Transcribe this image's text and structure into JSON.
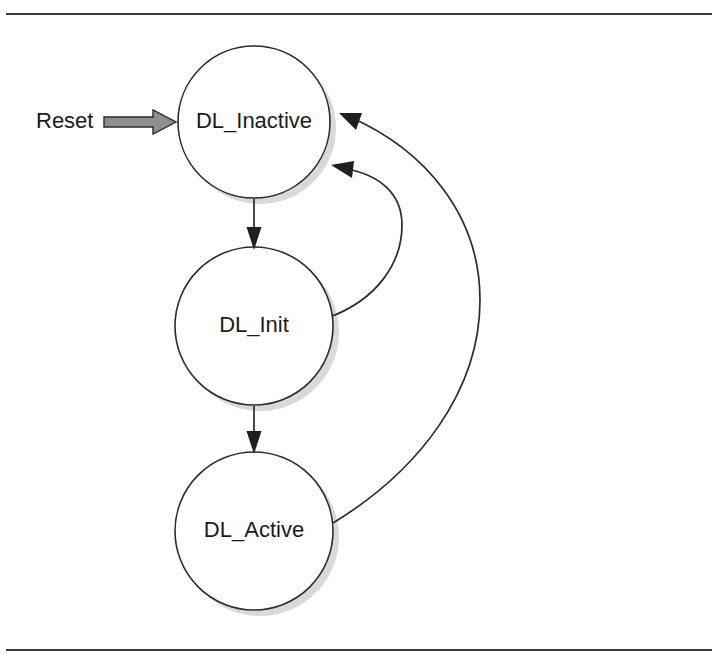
{
  "figure": {
    "kind": "state-transition-diagram",
    "background_color": "#ffffff",
    "line_color": "#2b2b2b",
    "shadow_color": "#b9b9b9",
    "reset_arrow_fill": "#8f8f8f",
    "frame_rule_color": "#3a3a3a"
  },
  "frame": {
    "top_rule_y": 14,
    "bottom_rule_y": 650,
    "rule_left_x": 6,
    "rule_right_x": 712
  },
  "states": [
    {
      "id": "dl-inactive",
      "label": "DL_Inactive",
      "cx": 254,
      "cy": 122,
      "r": 76
    },
    {
      "id": "dl-init",
      "label": "DL_Init",
      "cx": 254,
      "cy": 326,
      "r": 79
    },
    {
      "id": "dl-active",
      "label": "DL_Active",
      "cx": 254,
      "cy": 531,
      "r": 79
    }
  ],
  "entry": {
    "label": "Reset",
    "label_x": 36,
    "label_y": 122,
    "arrow_start_x": 104,
    "arrow_end_x": 176,
    "arrow_y": 122
  },
  "transitions": [
    {
      "id": "inactive-to-init",
      "from": "DL_Inactive",
      "to": "DL_Init",
      "shape": "straight-down"
    },
    {
      "id": "init-to-active",
      "from": "DL_Init",
      "to": "DL_Active",
      "shape": "straight-down"
    },
    {
      "id": "init-to-inactive",
      "from": "DL_Init",
      "to": "DL_Inactive",
      "shape": "curve-right-inner"
    },
    {
      "id": "active-to-inactive",
      "from": "DL_Active",
      "to": "DL_Inactive",
      "shape": "curve-right-outer"
    }
  ]
}
